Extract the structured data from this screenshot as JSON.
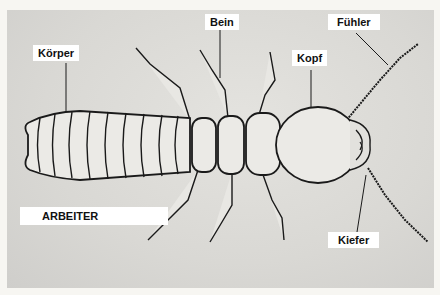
{
  "diagram": {
    "caption": "ARBEITER",
    "labels": [
      {
        "id": "koerper",
        "text": "Körper",
        "target": "body / abdomen"
      },
      {
        "id": "bein",
        "text": "Bein",
        "target": "leg"
      },
      {
        "id": "fuehler",
        "text": "Fühler",
        "target": "antenna"
      },
      {
        "id": "kopf",
        "text": "Kopf",
        "target": "head"
      },
      {
        "id": "kiefer",
        "text": "Kiefer",
        "target": "mandible"
      }
    ]
  },
  "colors": {
    "background": "#dcdbd7",
    "outline": "#1a1a1a",
    "label_bg": "#ffffff"
  }
}
